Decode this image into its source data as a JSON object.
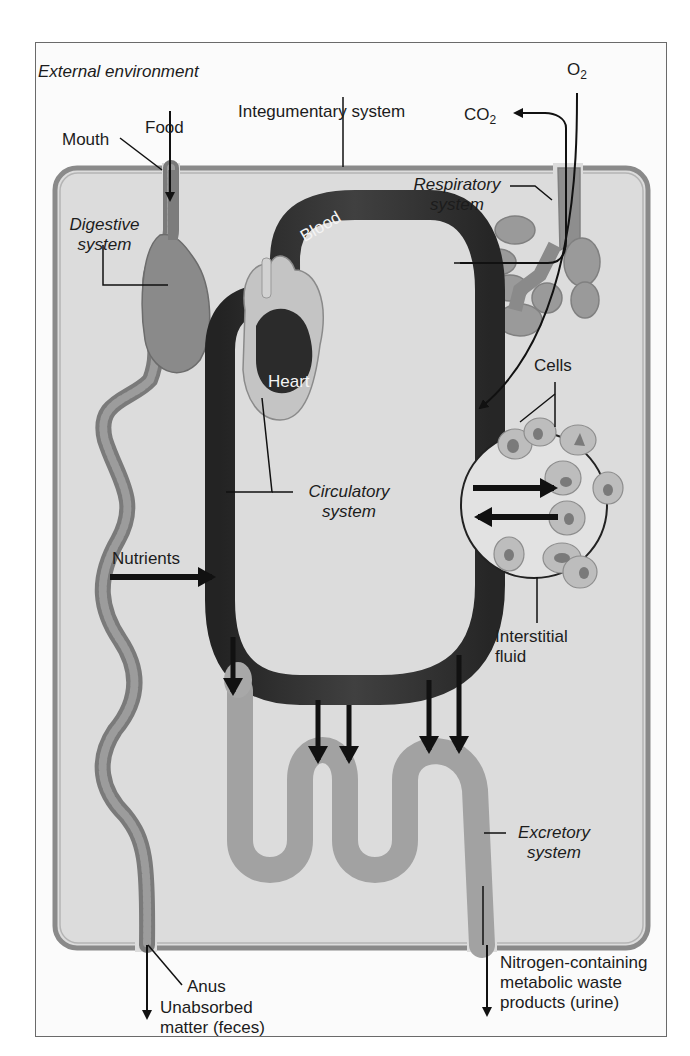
{
  "figure": {
    "title_label": "External environment",
    "colors": {
      "body_fill": "#dcdcdc",
      "body_border": "#8a8a8a",
      "blood_vessel": "#2e2e2e",
      "organ_tube": "#8e8e8e",
      "excretory_tube": "#a4a4a4",
      "lung": "#9a9a9a",
      "cell": "#b8b8b8",
      "arrow": "#111111"
    }
  },
  "labels": {
    "external_environment": "External environment",
    "integumentary_system": "Integumentary system",
    "o2": "O",
    "o2_sub": "2",
    "co2": "CO",
    "co2_sub": "2",
    "mouth": "Mouth",
    "food": "Food",
    "digestive_line1": "Digestive",
    "digestive_line2": "system",
    "respiratory_line1": "Respiratory",
    "respiratory_line2": "system",
    "blood": "Blood",
    "heart": "Heart",
    "cells": "Cells",
    "circulatory_line1": "Circulatory",
    "circulatory_line2": "system",
    "nutrients": "Nutrients",
    "interstitial_line1": "Interstitial",
    "interstitial_line2": "fluid",
    "excretory_line1": "Excretory",
    "excretory_line2": "system",
    "anus": "Anus",
    "feces_line1": "Unabsorbed",
    "feces_line2": "matter (feces)",
    "urine_line1": "Nitrogen-containing",
    "urine_line2": "metabolic waste",
    "urine_line3": "products (urine)"
  }
}
